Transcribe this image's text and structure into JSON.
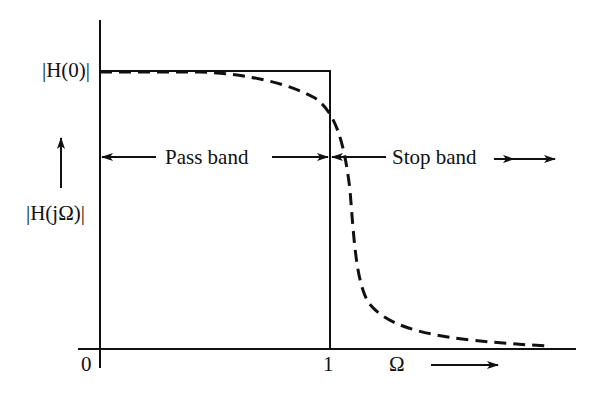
{
  "diagram": {
    "y_top_label": "|H(0)|",
    "y_axis_label": "|H(jΩ)|",
    "x_origin_label": "0",
    "x_cutoff_label": "1",
    "x_axis_label": "Ω",
    "pass_band_label": "Pass band",
    "stop_band_label": "Stop band",
    "curves": [
      {
        "name": "ideal",
        "style": "solid",
        "description": "rectangular response equal to |H(0)| from 0 to 1, zero beyond"
      },
      {
        "name": "practical",
        "style": "dashed",
        "description": "smooth response starting at |H(0)|, rolling off near Ω=1 and decaying toward zero"
      }
    ]
  }
}
